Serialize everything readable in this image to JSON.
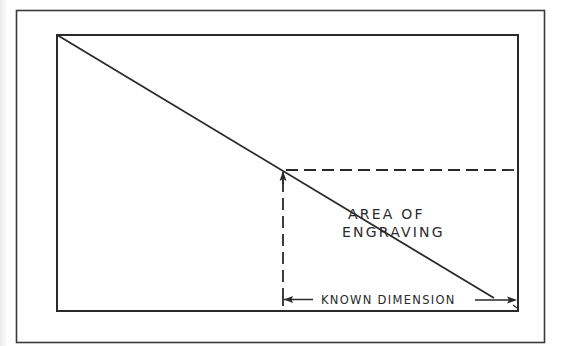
{
  "diagram": {
    "type": "engraving-dimension-sketch",
    "colors": {
      "background": "#ffffff",
      "line": "#2a2a2a"
    },
    "labels": {
      "area_line1": "AREA OF",
      "area_line2": "ENGRAVING",
      "known_dimension": "KNOWN DIMENSION"
    },
    "geometry": {
      "outer_frame": {
        "x1": 16,
        "y1": 10,
        "x2": 545,
        "y2": 343
      },
      "inner_rect": {
        "x1": 57,
        "y1": 35,
        "x2": 518,
        "y2": 311
      },
      "diagonal": {
        "from": [
          57,
          35
        ],
        "to": [
          494,
          298
        ]
      },
      "intersection": [
        283,
        170
      ],
      "horizontal_dashed": {
        "y": 170,
        "x1": 283,
        "x2": 518
      },
      "vertical_dashed": {
        "x": 283,
        "y1": 171,
        "y2": 295
      },
      "dimension_line": {
        "y": 299,
        "x1": 283,
        "x2": 517
      }
    }
  }
}
